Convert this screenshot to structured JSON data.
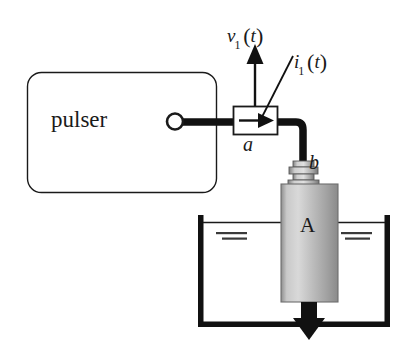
{
  "figure": {
    "type": "schematic-diagram",
    "background_color": "#ffffff",
    "ink_color": "#1a1a1a"
  },
  "blocks": {
    "pulser": {
      "label": "pulser",
      "shape": "rounded-rectangle",
      "x": 27,
      "y": 72,
      "width": 189,
      "height": 120,
      "corner_radius": 14,
      "stroke": "#1a1a1a",
      "fill": "#ffffff"
    },
    "terminal": {
      "name": "output-terminal",
      "shape": "circle",
      "cx": 175,
      "cy": 122,
      "r": 8
    },
    "current_probe": {
      "name": "current-probe",
      "label": "a",
      "shape": "rectangle",
      "x": 233,
      "y": 106,
      "width": 44,
      "height": 28,
      "inner_icon": "right-arrow"
    },
    "connector": {
      "name": "coaxial-connector",
      "label": "b",
      "x": 290,
      "y": 159,
      "width": 30,
      "height": 24
    },
    "transducer": {
      "name": "transducer-body",
      "label": "A",
      "x": 281,
      "y": 184,
      "width": 57,
      "height": 118,
      "fill_light": "#d8d8d8",
      "fill_dark": "#8f8f8f"
    },
    "tank": {
      "name": "water-tank",
      "x": 198,
      "y": 215,
      "width": 192,
      "height": 112,
      "wall_thickness": 5,
      "open_top": true,
      "water_line_y": 222
    }
  },
  "labels": {
    "voltage": {
      "symbol": "v",
      "subscript": "1",
      "argument": "t",
      "text": "v1(t)"
    },
    "current": {
      "symbol": "i",
      "subscript": "1",
      "argument": "t",
      "text": "i1(t)"
    },
    "node_a": "a",
    "node_b": "b",
    "transducer": "A",
    "pulser": "pulser"
  },
  "arrows": {
    "voltage_arrow": {
      "name": "voltage-measurement-arrow",
      "direction": "up",
      "x": 255,
      "from_y": 106,
      "to_y": 48
    },
    "current_arrow": {
      "name": "current-direction-arrow",
      "direction": "right",
      "y": 120
    },
    "leader_line": {
      "name": "current-label-leader",
      "from": [
        293,
        57
      ],
      "to": [
        262,
        118
      ]
    },
    "acoustic_beam_arrow": {
      "name": "acoustic-beam-arrow",
      "direction": "down",
      "x": 309,
      "from_y": 302,
      "to_y": 330
    }
  },
  "cable": {
    "name": "coaxial-cable",
    "stroke_width": 7,
    "path": "pulser-terminal to current-probe to connector"
  },
  "water_marks": {
    "left": [
      {
        "x": 216,
        "y": 233,
        "width": 30,
        "height": 2
      },
      {
        "x": 222,
        "y": 238,
        "width": 24,
        "height": 2
      }
    ],
    "right": [
      {
        "x": 342,
        "y": 233,
        "width": 30,
        "height": 2
      },
      {
        "x": 346,
        "y": 238,
        "width": 24,
        "height": 2
      }
    ]
  }
}
